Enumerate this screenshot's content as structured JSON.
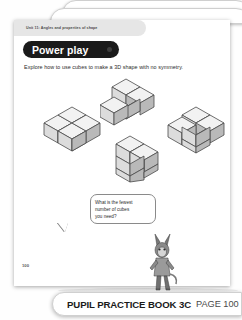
{
  "document": {
    "unit_header": "Unit 11: Angles and properties of shape",
    "page_number": "100"
  },
  "section": {
    "banner_label": "Power play",
    "instruction": "Explore how to use cubes to make a 3D shape with no symmetry."
  },
  "speech_bubble": {
    "line1": "What is the fewest",
    "line2": "number of cubes",
    "line3": "you need?"
  },
  "footer": {
    "book_label": "PUPIL PRACTICE BOOK 3C",
    "page_label": "PAGE 100"
  },
  "colors": {
    "banner_bg": "#1a1a1a",
    "banner_text": "#ffffff",
    "page_bg": "#ffffff",
    "cube_top": "#f2f2f2",
    "cube_left": "#dcdcdc",
    "cube_right": "#b9b9b9",
    "cube_outline": "#4a4a4a",
    "header_tab_bg": "#e6e6e6"
  },
  "shapes": [
    {
      "name": "flat-four-cube-shape",
      "description": "Four cubes arranged flat in a 2x2 block with a notch",
      "cube_count": 4
    },
    {
      "name": "l-shape-with-stacked-cube",
      "description": "L-shaped arrangement of cubes with one cube stacked on top",
      "cube_count": 4
    },
    {
      "name": "l-tromino-with-stacked-cube",
      "description": "L-shaped tromino with a cube stacked on top",
      "cube_count": 4
    },
    {
      "name": "t-shape-with-stacked-cube",
      "description": "T-shaped arrangement with a cube stacked on top",
      "cube_count": 4
    }
  ]
}
